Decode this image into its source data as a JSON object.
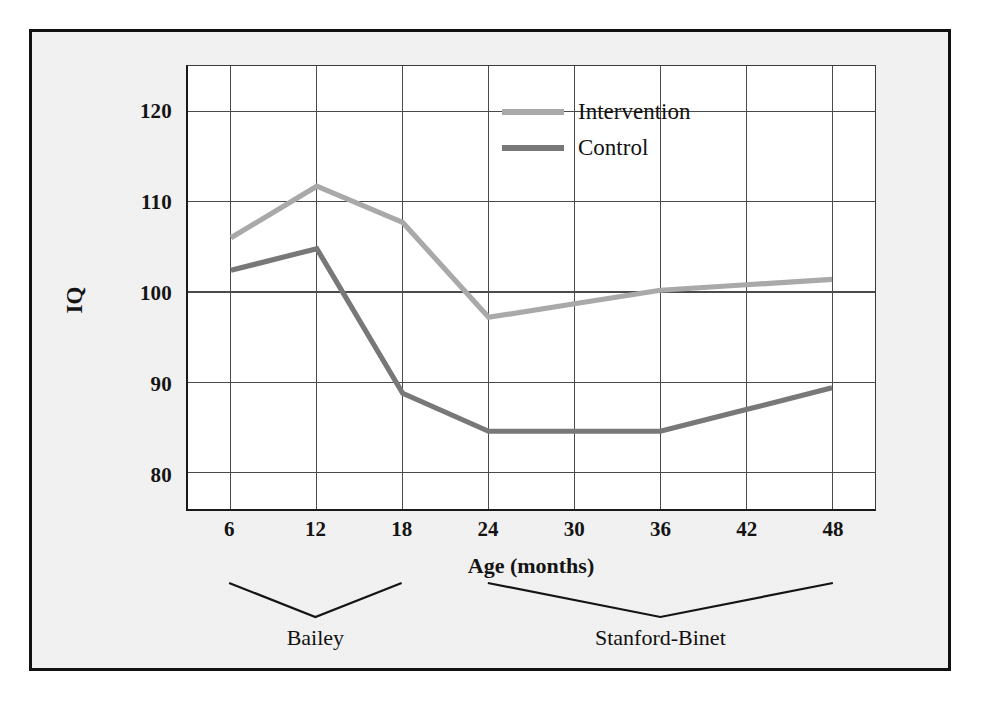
{
  "figure": {
    "background_color": "#ededed",
    "plot_background_color": "#ffffff",
    "frame_color": "#111111"
  },
  "chart_data": {
    "type": "line",
    "title": "",
    "xlabel": "Age (months)",
    "ylabel": "IQ",
    "categories": [
      "6",
      "12",
      "18",
      "24",
      "30",
      "36",
      "42",
      "48"
    ],
    "x_tick_labels": [
      "6",
      "12",
      "18",
      "24",
      "30",
      "36",
      "42",
      "48"
    ],
    "y_tick_labels": [
      "80",
      "90",
      "100",
      "110",
      "120"
    ],
    "y_ticks": [
      80,
      90,
      100,
      110,
      120
    ],
    "ylim": [
      76,
      125
    ],
    "grid": true,
    "legend_position": "upper-center-right",
    "series": [
      {
        "name": "Intervention",
        "color": "#a9a9a9",
        "values": [
          106.0,
          111.7,
          107.7,
          97.2,
          98.7,
          100.2,
          100.8,
          101.4
        ]
      },
      {
        "name": "Control",
        "color": "#787878",
        "values": [
          102.4,
          104.8,
          88.8,
          84.6,
          84.6,
          84.6,
          87.0,
          89.4
        ]
      }
    ],
    "annotations": [
      {
        "label": "Bailey",
        "span_categories": [
          "6",
          "18"
        ],
        "kind": "v-brace"
      },
      {
        "label": "Stanford-Binet",
        "span_categories": [
          "24",
          "48"
        ],
        "kind": "v-brace"
      }
    ]
  },
  "legend": {
    "entries": [
      {
        "label": "Intervention",
        "color": "#a9a9a9"
      },
      {
        "label": "Control",
        "color": "#787878"
      }
    ]
  }
}
